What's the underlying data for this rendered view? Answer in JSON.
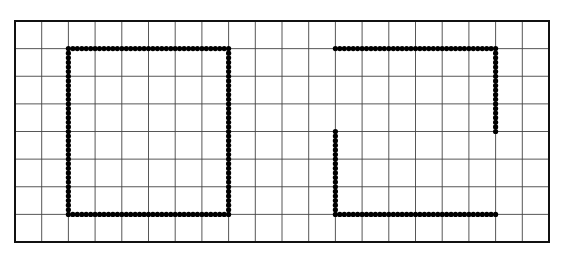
{
  "grid": {
    "columns": 20,
    "rows": 8,
    "left": 15,
    "top": 21,
    "right": 549,
    "bottom": 242,
    "line_color": "#444444",
    "border_color": "#111111",
    "background": "#ffffff"
  },
  "dots": {
    "color": "#000000",
    "radius": 2.6,
    "per_cell": 6
  },
  "shapes": [
    {
      "name": "closed-square",
      "description": "Closed dotted square outline",
      "path": [
        [
          2,
          1
        ],
        [
          8,
          1
        ],
        [
          8,
          7
        ],
        [
          2,
          7
        ],
        [
          2,
          1
        ]
      ]
    },
    {
      "name": "open-square",
      "description": "Dotted square outline with an opening on the right and left sides",
      "segments": [
        [
          [
            12,
            1
          ],
          [
            18,
            1
          ]
        ],
        [
          [
            18,
            1
          ],
          [
            18,
            4
          ]
        ],
        [
          [
            12,
            4
          ],
          [
            12,
            7
          ]
        ],
        [
          [
            12,
            7
          ],
          [
            18,
            7
          ]
        ]
      ]
    }
  ]
}
